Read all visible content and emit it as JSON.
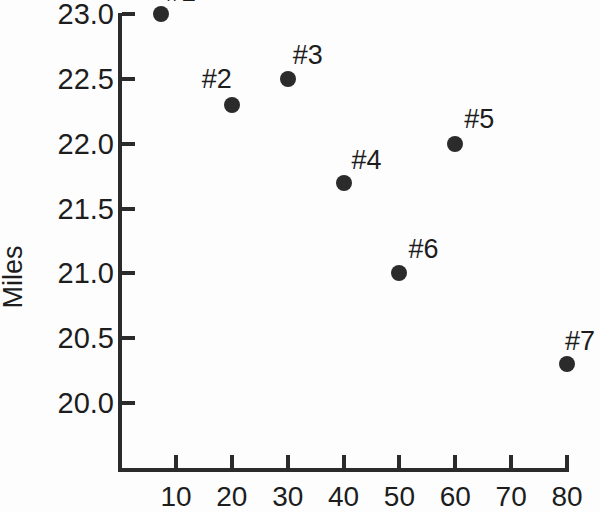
{
  "chart_data": {
    "type": "scatter",
    "title": "",
    "xlabel": "",
    "ylabel": "Miles",
    "xlim": [
      0,
      80
    ],
    "ylim": [
      19.8,
      23.15
    ],
    "grid": false,
    "legend": null,
    "x_ticks": [
      "10",
      "20",
      "30",
      "40",
      "50",
      "60",
      "70",
      "80"
    ],
    "x_tick_values": [
      10,
      20,
      30,
      40,
      50,
      60,
      70,
      80
    ],
    "y_ticks": [
      "20.0",
      "20.5",
      "21.0",
      "21.5",
      "22.0",
      "22.5",
      "23.0"
    ],
    "y_tick_values": [
      20.0,
      20.5,
      21.0,
      21.5,
      22.0,
      22.5,
      23.0
    ],
    "marker_color": "#2b2b2b",
    "axis_color": "#2b2b2b",
    "background_color": "#fdfdfd",
    "points": [
      {
        "label": "#1",
        "x": 7.3,
        "y": 23.0,
        "label_dx": 20,
        "label_dy": -22,
        "label_clipped": true
      },
      {
        "label": "#2",
        "x": 20,
        "y": 22.3,
        "label_dx": -15,
        "label_dy": -26,
        "label_clipped": false
      },
      {
        "label": "#3",
        "x": 30,
        "y": 22.5,
        "label_dx": 20,
        "label_dy": -24,
        "label_clipped": false
      },
      {
        "label": "#4",
        "x": 40,
        "y": 21.7,
        "label_dx": 23,
        "label_dy": -23,
        "label_clipped": false
      },
      {
        "label": "#5",
        "x": 60,
        "y": 22.0,
        "label_dx": 24,
        "label_dy": -25,
        "label_clipped": false
      },
      {
        "label": "#6",
        "x": 50,
        "y": 21.0,
        "label_dx": 24,
        "label_dy": -24,
        "label_clipped": false
      },
      {
        "label": "#7",
        "x": 80,
        "y": 20.3,
        "label_dx": 13,
        "label_dy": -23,
        "label_clipped": false
      }
    ]
  },
  "axes": {
    "y_title": "Miles"
  }
}
